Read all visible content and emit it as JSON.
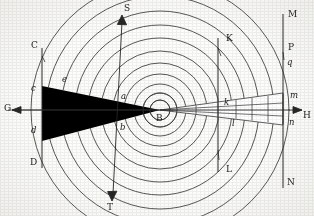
{
  "figure": {
    "background_color": "#fdfdfb",
    "ink_color": "#262626",
    "fill_color": "#000000",
    "width": 314,
    "height": 216
  },
  "center": {
    "label": "B",
    "x": 160,
    "y": 110
  },
  "axes": {
    "horizontal": {
      "name": "G-H axis",
      "left_label": "G",
      "right_label": "H",
      "y": 110,
      "x_start": 8,
      "x_end": 306
    },
    "diagonal": {
      "name": "S-T axis",
      "top_label": "S",
      "bottom_label": "T",
      "top_x": 122,
      "top_y": 18,
      "bottom_x": 112,
      "bottom_y": 198
    }
  },
  "vertical_lines": [
    {
      "name": "line-CD",
      "x": 42,
      "y_top": 48,
      "y_bottom": 168,
      "top_label": "C",
      "bottom_label": "D",
      "inner_top_label": "c",
      "inner_bottom_label": "d"
    },
    {
      "name": "line-KL",
      "x": 218,
      "y_top": 38,
      "y_bottom": 172,
      "top_label": "K",
      "bottom_label": "L",
      "inner_top_label": "k",
      "inner_bottom_label": "l"
    },
    {
      "name": "line-MN",
      "x": 283,
      "y_top": 14,
      "y_bottom": 188,
      "top_label": "M",
      "bottom_label": "N",
      "inner_top_label": "m",
      "inner_bottom_label": "n"
    }
  ],
  "point_labels": [
    {
      "text": "C",
      "x": 31,
      "y": 41,
      "case": "cap"
    },
    {
      "text": "c",
      "x": 31,
      "y": 84,
      "case": "low"
    },
    {
      "text": "d",
      "x": 31,
      "y": 126,
      "case": "low"
    },
    {
      "text": "D",
      "x": 30,
      "y": 158,
      "case": "cap"
    },
    {
      "text": "e",
      "x": 62,
      "y": 75,
      "case": "low"
    },
    {
      "text": "a",
      "x": 121,
      "y": 92,
      "case": "low"
    },
    {
      "text": "b",
      "x": 120,
      "y": 123,
      "case": "low"
    },
    {
      "text": "B",
      "x": 156,
      "y": 114,
      "case": "cap"
    },
    {
      "text": "K",
      "x": 226,
      "y": 34,
      "case": "cap"
    },
    {
      "text": "k",
      "x": 224,
      "y": 98,
      "case": "low"
    },
    {
      "text": "l",
      "x": 232,
      "y": 119,
      "case": "low"
    },
    {
      "text": "L",
      "x": 226,
      "y": 165,
      "case": "cap"
    },
    {
      "text": "M",
      "x": 288,
      "y": 10,
      "case": "cap"
    },
    {
      "text": "P",
      "x": 288,
      "y": 43,
      "case": "cap"
    },
    {
      "text": "q",
      "x": 287,
      "y": 58,
      "case": "low"
    },
    {
      "text": "m",
      "x": 290,
      "y": 91,
      "case": "low"
    },
    {
      "text": "n",
      "x": 289,
      "y": 118,
      "case": "low"
    },
    {
      "text": "N",
      "x": 287,
      "y": 178,
      "case": "cap"
    },
    {
      "text": "S",
      "x": 124,
      "y": 4,
      "case": "cap"
    },
    {
      "text": "T",
      "x": 107,
      "y": 203,
      "case": "cap"
    },
    {
      "text": "G",
      "x": 4,
      "y": 104,
      "case": "cap"
    },
    {
      "text": "H",
      "x": 303,
      "y": 111,
      "case": "cap"
    }
  ],
  "wavefronts": {
    "name": "concentric-wavefront-arcs",
    "center_label": "B",
    "count": 11,
    "radii": [
      10,
      17,
      26,
      36,
      47,
      59,
      72,
      85,
      99,
      114,
      129
    ],
    "stroke": "#3a3a3a"
  },
  "left_wedge": {
    "name": "black-shadow-wedge",
    "description": "solid black triangular wedge, apex at centre B, base on line CD",
    "apex_x": 160,
    "apex_y": 110,
    "base_x": 42,
    "base_top_y": 87,
    "base_bottom_y": 140,
    "fill": "#000000"
  },
  "right_cone": {
    "name": "divergent-beam-cone",
    "description": "narrow cone diverging rightwards from centre B to line MN, subdivided by cross lines",
    "apex_x": 160,
    "apex_y": 110,
    "end_x": 283,
    "end_top_y": 94,
    "end_bottom_y": 124,
    "division_x": [
      196,
      218,
      236,
      252,
      268,
      283
    ]
  },
  "rays": {
    "name": "ray-lines",
    "description": "straight rays from centre B through a, b and along the cone edges",
    "left_ray_top": {
      "x": 42,
      "y": 87
    },
    "left_ray_bottom": {
      "x": 42,
      "y": 140
    }
  }
}
